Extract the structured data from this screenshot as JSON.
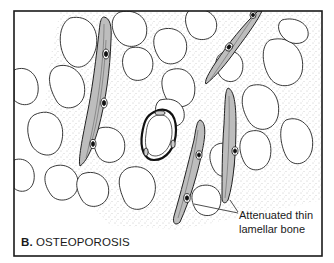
{
  "figure": {
    "panel_letter": "B.",
    "panel_title": "OSTEOPOROSIS",
    "annotation": {
      "line1": "Attenuated thin",
      "line2": "lamellar bone"
    },
    "colors": {
      "border": "#1a1a1a",
      "trabecula_fill": "#b8b8b8",
      "marrow_stipple": "#9a9a9a",
      "background": "#ffffff"
    },
    "elements": [
      "marrow-spaces",
      "thin-trabeculae",
      "osteocytes",
      "central-vessel",
      "annotation-leader-lines"
    ]
  }
}
